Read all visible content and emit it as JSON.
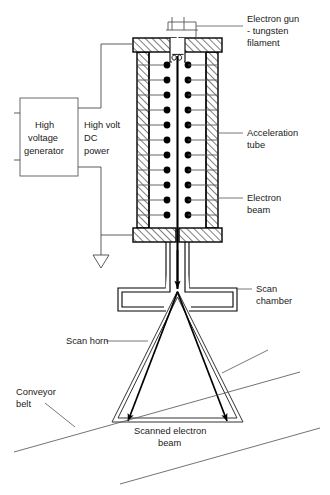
{
  "diagram": {
    "background_color": "#ffffff",
    "ink_color": "#000000",
    "label_color": "#1a1a1a",
    "leader_color": "#555555"
  },
  "labels": {
    "electron_gun_line1": "Electron gun",
    "electron_gun_line2": "- tungsten",
    "electron_gun_line3": "filament",
    "acceleration_tube_line1": "Acceleration",
    "acceleration_tube_line2": "tube",
    "electron_beam_line1": "Electron",
    "electron_beam_line2": "beam",
    "scan_chamber_line1": "Scan",
    "scan_chamber_line2": "chamber",
    "scan_horn": "Scan horn",
    "conveyor_belt_line1": "Conveyor",
    "conveyor_belt_line2": "belt",
    "scanned_beam_line1": "Scanned electron",
    "scanned_beam_line2": "beam",
    "hv_generator_line1": "High",
    "hv_generator_line2": "voltage",
    "hv_generator_line3": "generator",
    "hv_power_line1": "High volt",
    "hv_power_line2": "DC",
    "hv_power_line3": "power"
  },
  "components": {
    "electrode_pair_count": 11,
    "electrode_rows_y": [
      65,
      80,
      95,
      110,
      125,
      140,
      155,
      170,
      185,
      200,
      215
    ],
    "electrode_left_x": 167,
    "electrode_right_x": 188,
    "electrode_radius": 3.4,
    "ground_symbol": "earth-ground-triangle",
    "filament_coil_loops": 2
  },
  "icons": {
    "ground": "ground-icon",
    "filament": "filament-coil-icon",
    "beam_arrow": "arrow-down-icon"
  }
}
